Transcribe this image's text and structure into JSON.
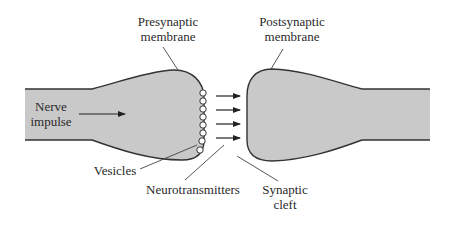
{
  "diagram": {
    "colors": {
      "fill": "#c9c9c9",
      "stroke": "#333333",
      "text": "#2a2a2a",
      "background": "#ffffff"
    },
    "labels": {
      "presynaptic": {
        "line1": "Presynaptic",
        "line2": "membrane"
      },
      "postsynaptic": {
        "line1": "Postsynaptic",
        "line2": "membrane"
      },
      "nerve_impulse": {
        "line1": "Nerve",
        "line2": "impulse"
      },
      "vesicles": "Vesicles",
      "neurotransmitters": "Neurotransmitters",
      "synaptic_cleft": {
        "line1": "Synaptic",
        "line2": "cleft"
      }
    },
    "vesicle_count": 8,
    "neurotransmitter_arrow_count": 4
  }
}
